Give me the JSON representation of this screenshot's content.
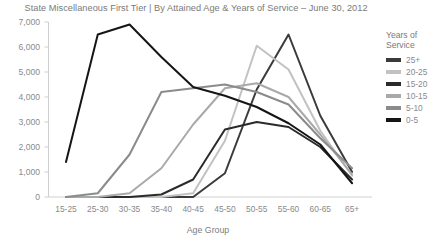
{
  "chart_data": {
    "type": "line",
    "title": "State Miscellaneous First Tier | By Attained Age & Years of Service – June 30, 2012",
    "xlabel": "Age Group",
    "ylabel": "",
    "categories": [
      "15-25",
      "25-30",
      "30-35",
      "35-40",
      "40-45",
      "45-50",
      "50-55",
      "55-60",
      "60-65",
      "65+"
    ],
    "ylim": [
      0,
      7000
    ],
    "ytick_labels": [
      "7,000",
      "6,000",
      "5,000",
      "4,000",
      "3,000",
      "2,000",
      "1,000",
      "0"
    ],
    "ytick_values": [
      7000,
      6000,
      5000,
      4000,
      3000,
      2000,
      1000,
      0
    ],
    "grid": false,
    "legend_position": "right",
    "legend_title": "Years of Service",
    "series": [
      {
        "name": "25+",
        "color": "#3b3b3b",
        "values": [
          0,
          0,
          0,
          0,
          0,
          950,
          4300,
          6500,
          3250,
          1000
        ]
      },
      {
        "name": "20-25",
        "color": "#c2c2c2",
        "values": [
          0,
          0,
          0,
          0,
          150,
          2250,
          6050,
          5100,
          2650,
          850
        ]
      },
      {
        "name": "15-20",
        "color": "#2b2b2b",
        "values": [
          0,
          0,
          0,
          100,
          700,
          2700,
          3000,
          2800,
          2000,
          700
        ]
      },
      {
        "name": "10-15",
        "color": "#a9a9a9",
        "values": [
          0,
          0,
          150,
          1150,
          2900,
          4350,
          4550,
          4000,
          2500,
          900
        ]
      },
      {
        "name": "5-10",
        "color": "#8b8b8b",
        "values": [
          0,
          150,
          1700,
          4200,
          4350,
          4500,
          4200,
          3700,
          2350,
          1150
        ]
      },
      {
        "name": "0-5",
        "color": "#151515",
        "values": [
          1400,
          6500,
          6900,
          5600,
          4400,
          4050,
          3600,
          2950,
          2100,
          550
        ]
      }
    ]
  },
  "legend": {
    "title_line1": "Years of",
    "title_line2": "Service",
    "items": [
      {
        "label": "25+"
      },
      {
        "label": "20-25"
      },
      {
        "label": "15-20"
      },
      {
        "label": "10-15"
      },
      {
        "label": "5-10"
      },
      {
        "label": "0-5"
      }
    ]
  }
}
